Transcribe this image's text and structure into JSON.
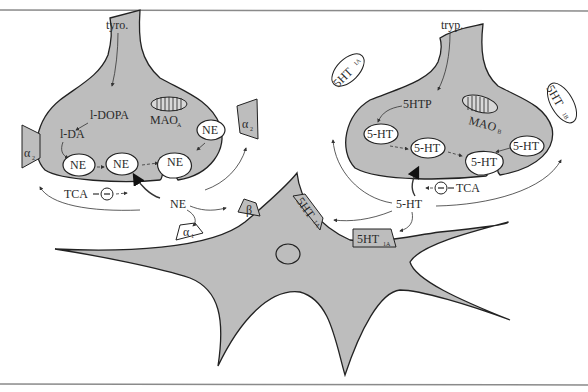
{
  "diagram": {
    "colors": {
      "cell_fill": "#bdbdbd",
      "outline": "#222222",
      "vesicle_fill": "#ffffff",
      "rule": "#8a8a8a"
    },
    "noradrenergic_terminal": {
      "precursor": "tyro.",
      "intermediate_1": "l-DOPA",
      "intermediate_2": "l-DA",
      "vesicles": [
        "NE",
        "NE",
        "NE",
        "NE"
      ],
      "enzyme": {
        "label": "MAO",
        "sub": "A"
      },
      "autoreceptor_left": {
        "label": "α",
        "sub": "2"
      },
      "autoreceptor_right": {
        "label": "α",
        "sub": "2"
      },
      "reuptake_blocker": "TCA",
      "inhibit_symbol": "−",
      "released": "NE"
    },
    "serotonergic_terminal": {
      "precursor": "tryp.",
      "intermediate": "5HTP",
      "vesicles": [
        "5-HT",
        "5-HT",
        "5-HT",
        "5-HT"
      ],
      "enzyme": {
        "label": "MAO",
        "sub": "B"
      },
      "autoreceptor_left": {
        "label": "5HT",
        "sub": "1A"
      },
      "autoreceptor_right": {
        "label": "5HT",
        "sub": "1B"
      },
      "reuptake_blocker": "TCA",
      "inhibit_symbol": "−",
      "released": "5-HT"
    },
    "postsynaptic_neuron": {
      "receptors": [
        {
          "label": "α",
          "sub": "1"
        },
        {
          "label": "β",
          "sub": ""
        },
        {
          "label": "5HT",
          "sub": "1A"
        },
        {
          "label": "5HT",
          "sub": "1A"
        }
      ]
    }
  }
}
